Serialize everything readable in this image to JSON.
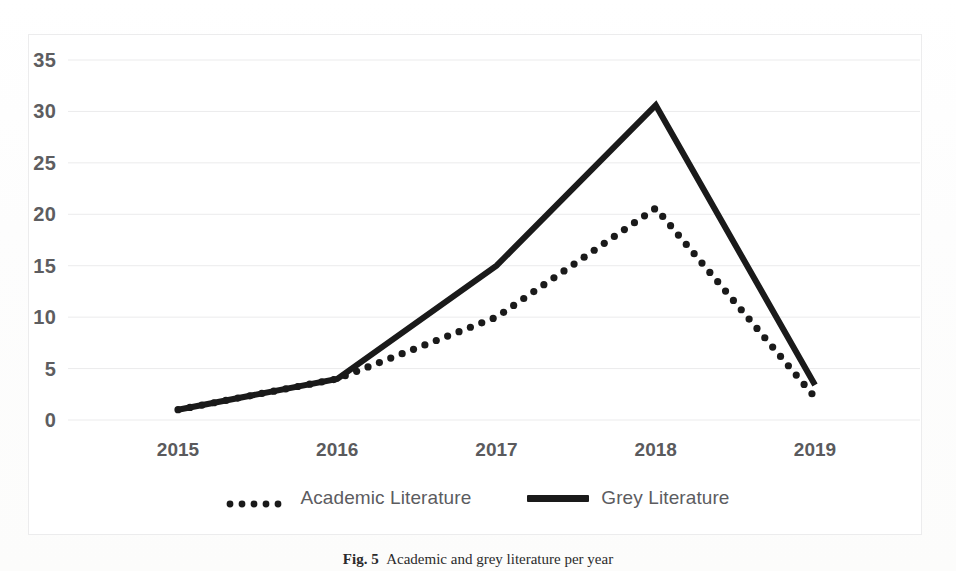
{
  "figure": {
    "caption_prefix": "Fig. 5",
    "caption_text": "Academic and grey literature per year"
  },
  "chart_data": {
    "type": "line",
    "title": "",
    "xlabel": "",
    "ylabel": "",
    "categories": [
      "2015",
      "2016",
      "2017",
      "2018",
      "2019"
    ],
    "x": [
      2015,
      2016,
      2017,
      2018,
      2019
    ],
    "ylim": [
      0,
      35
    ],
    "yticks": [
      0,
      5,
      10,
      15,
      20,
      25,
      30,
      35
    ],
    "ytick_labels": [
      "0",
      "5",
      "10",
      "15",
      "20",
      "25",
      "30",
      "35"
    ],
    "grid": true,
    "grid_axis": "y",
    "legend_position": "bottom",
    "series": [
      {
        "name": "Academic Literature",
        "style": "dotted",
        "color": "#1a1a1a",
        "values": [
          1,
          4,
          10,
          20.6,
          2.2
        ]
      },
      {
        "name": "Grey Literature",
        "style": "solid",
        "color": "#1a1a1a",
        "values": [
          1,
          4,
          15,
          30.6,
          3.4
        ]
      }
    ]
  },
  "legend": {
    "items": [
      {
        "label": "Academic Literature",
        "marker": "dotted-line-swatch"
      },
      {
        "label": "Grey Literature",
        "marker": "solid-line-swatch"
      }
    ]
  },
  "colors": {
    "line": "#1a1a1a",
    "gridline": "#ebebec",
    "border": "#ececed",
    "tick_text": "#5c5c5f",
    "plot_background": "#ffffff"
  }
}
